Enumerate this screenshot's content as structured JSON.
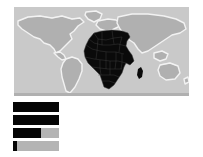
{
  "map": {
    "name": "world-choropleth",
    "ocean_color": "#c9c9c9",
    "land_color": "#b0b0b0",
    "coastline_color": "#f2f2f2",
    "highlight_color": "#0a0a0a",
    "highlighted_region": "Africa"
  },
  "chart_data": {
    "type": "bar",
    "orientation": "horizontal",
    "title": "",
    "xlabel": "",
    "ylabel": "",
    "categories": [
      "bar-1",
      "bar-2",
      "bar-3",
      "bar-4"
    ],
    "values": [
      100,
      100,
      60,
      8
    ],
    "xlim": [
      0,
      100
    ],
    "grid": false,
    "legend": "none",
    "fill_color": "#050505",
    "track_color": "#b4b4b4"
  }
}
